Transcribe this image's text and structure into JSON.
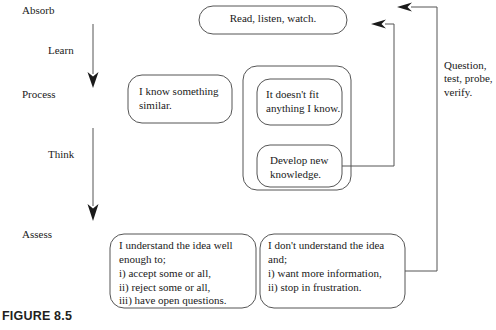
{
  "figure": {
    "caption": "FIGURE 8.5"
  },
  "stages": [
    {
      "id": "absorb",
      "label": "Absorb",
      "x": 22,
      "y": 4
    },
    {
      "id": "process",
      "label": "Process",
      "x": 22,
      "y": 88
    },
    {
      "id": "assess",
      "label": "Assess",
      "x": 22,
      "y": 228
    }
  ],
  "transitions": [
    {
      "id": "learn",
      "label": "Learn",
      "x": 48,
      "y": 44
    },
    {
      "id": "think",
      "label": "Think",
      "x": 48,
      "y": 148
    }
  ],
  "side_note": {
    "id": "question-test-probe-verify",
    "lines": "Question,\ntest, probe,\nverify.",
    "x": 444,
    "y": 59
  },
  "nodes": [
    {
      "id": "read-listen-watch",
      "text": "Read, listen, watch.",
      "x": 199,
      "y": 6,
      "w": 148,
      "h": 28,
      "align": "centered",
      "text_x": 212,
      "text_y": 12
    },
    {
      "id": "i-know-something-similar",
      "text": "I know something\nsimilar.",
      "x": 128,
      "y": 75,
      "w": 104,
      "h": 48,
      "align": "left",
      "text_x": 139,
      "text_y": 85
    },
    {
      "id": "container-process",
      "text": "",
      "x": 243,
      "y": 66,
      "w": 108,
      "h": 124,
      "align": "left",
      "text_x": 0,
      "text_y": 0
    },
    {
      "id": "it-doesnt-fit",
      "text": "It doesn't fit\nanything I know.",
      "x": 257,
      "y": 79,
      "w": 85,
      "h": 46,
      "align": "left",
      "text_x": 266,
      "text_y": 88
    },
    {
      "id": "develop-new-knowledge",
      "text": "Develop new\nknowledge.",
      "x": 257,
      "y": 145,
      "w": 85,
      "h": 42,
      "align": "left",
      "text_x": 270,
      "text_y": 154
    },
    {
      "id": "i-understand-the-idea",
      "text": "I understand the idea well\nenough to;\ni) accept some or all,\nii) reject some or all,\niii) have open questions.",
      "x": 110,
      "y": 234,
      "w": 146,
      "h": 74,
      "align": "left",
      "text_x": 119,
      "text_y": 239
    },
    {
      "id": "i-dont-understand-the-idea",
      "text": "I don't understand the idea\nand;\ni) want more information,\nii) stop in frustration.",
      "x": 260,
      "y": 234,
      "w": 145,
      "h": 74,
      "align": "left",
      "text_x": 268,
      "text_y": 239
    }
  ],
  "style": {
    "stroke": "#555555",
    "arrow_fill": "#1a1a1a",
    "background": "#ffffff"
  }
}
